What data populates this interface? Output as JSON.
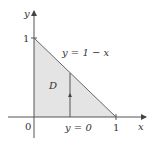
{
  "diagram": {
    "region_label": "D",
    "curve_label": "y = 1 − x",
    "bottom_label": "y = 0",
    "x_axis_label": "x",
    "y_axis_label": "y",
    "origin_label": "0",
    "x_tick_label": "1",
    "y_tick_label": "1",
    "colors": {
      "region_fill": "#e4e4e4",
      "axis": "#555555",
      "boundary": "#555555"
    }
  }
}
